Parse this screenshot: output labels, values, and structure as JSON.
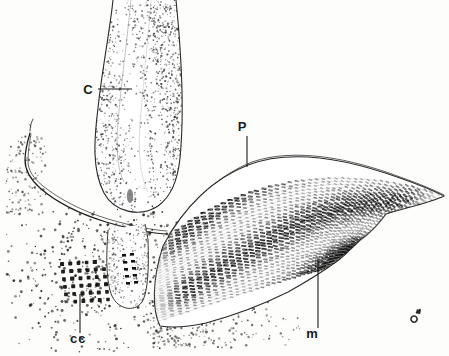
{
  "figure": {
    "background_color": "#fdfdfb",
    "ink_color": "#1a1a1a",
    "width": 449,
    "height": 356
  },
  "labels": [
    {
      "id": "c",
      "text": "C",
      "name": "label-c",
      "meaning": "cartilage / odontophoral cartilage",
      "x": 88,
      "y": 94,
      "font_size": 13,
      "leader": {
        "x1": 98,
        "y1": 89,
        "x2": 132,
        "y2": 89,
        "type": "horizontal"
      }
    },
    {
      "id": "p",
      "text": "P",
      "name": "label-p",
      "meaning": "protractor / periostracum layer",
      "x": 242,
      "y": 131,
      "font_size": 13,
      "leader": {
        "x1": 247,
        "y1": 136,
        "x2": 247,
        "y2": 167,
        "type": "vertical"
      }
    },
    {
      "id": "m",
      "text": "m",
      "name": "label-m",
      "meaning": "muscle fibres",
      "x": 312,
      "y": 338,
      "font_size": 13,
      "leader": {
        "x1": 318,
        "y1": 328,
        "x2": 318,
        "y2": 258,
        "type": "vertical"
      }
    },
    {
      "id": "cc",
      "text": "cc",
      "name": "label-cc",
      "meaning": "cartilage cells",
      "x": 70,
      "y": 343,
      "font_size": 13,
      "leader": {
        "x1": 80,
        "y1": 333,
        "x2": 80,
        "y2": 294,
        "type": "vertical"
      }
    }
  ],
  "signature": {
    "name": "artist-monogram",
    "text": "",
    "x": 416,
    "y": 316
  },
  "structures": [
    {
      "name": "curved-organ",
      "label_ref": "c",
      "shading": "stipple"
    },
    {
      "name": "hatched-muscle-mass",
      "label_ref": "p",
      "shading": "dashed-fibre-hatching"
    },
    {
      "name": "lower-bulb",
      "label_ref": null,
      "shading": "stipple-with-dashes"
    },
    {
      "name": "membrane-line",
      "label_ref": null,
      "shading": "double-line"
    },
    {
      "name": "cell-cluster-grid",
      "label_ref": "cc",
      "shading": "dot-grid"
    },
    {
      "name": "stipple-field",
      "label_ref": null,
      "shading": "scatter-stipple"
    }
  ]
}
